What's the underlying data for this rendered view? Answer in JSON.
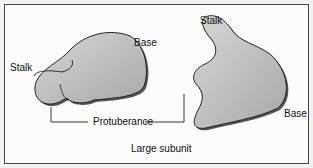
{
  "diagram": {
    "title": "Large subunit",
    "left_view": {
      "labels": {
        "stalk": "Stalk",
        "base": "Base"
      }
    },
    "right_view": {
      "labels": {
        "stalk": "Stalk",
        "base": "Base"
      }
    },
    "shared_labels": {
      "protuberance": "Protuberance"
    },
    "colors": {
      "fill": "#b8b8b8",
      "shadow": "#555555",
      "outline": "#222222"
    }
  }
}
